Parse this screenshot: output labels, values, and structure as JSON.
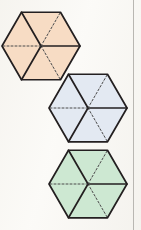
{
  "figure": {
    "kind": "geometry-figure",
    "canvas": {
      "width": 141,
      "height": 230,
      "background": "#fbfaf7"
    },
    "page_rule": {
      "visible": true,
      "x": 133,
      "color": "#b9b7b2"
    },
    "stroke": {
      "solid_color": "#231f20",
      "dashed_color": "#4a4a4a",
      "solid_width": 1.7,
      "dashed_width": 1.0,
      "dash_pattern": "2,2"
    },
    "diagonal_styles": [
      {
        "name": "upper-left",
        "style": "solid"
      },
      {
        "name": "upper-right",
        "style": "dashed"
      },
      {
        "name": "right-horizontal",
        "style": "solid"
      },
      {
        "name": "lower-right",
        "style": "dashed"
      },
      {
        "name": "lower-left",
        "style": "solid"
      },
      {
        "name": "left-horizontal",
        "style": "dashed"
      }
    ],
    "hexagons": [
      {
        "id": "hexagon-orange",
        "label": "orange hexagon",
        "fill": "#f7dcc4",
        "outline": "#231f20",
        "center_x": 41,
        "center_y": 46,
        "radius": 39,
        "triangles": 6
      },
      {
        "id": "hexagon-blue",
        "label": "blue hexagon",
        "fill": "#e3e9f2",
        "outline": "#231f20",
        "center_x": 88,
        "center_y": 108,
        "radius": 39,
        "triangles": 6
      },
      {
        "id": "hexagon-green",
        "label": "green hexagon",
        "fill": "#cde8d2",
        "outline": "#231f20",
        "center_x": 88,
        "center_y": 184,
        "radius": 39,
        "triangles": 6
      }
    ]
  }
}
